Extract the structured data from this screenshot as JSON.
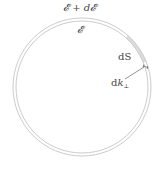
{
  "diagram": {
    "labels": {
      "outer_surface": "𝓔 + d𝓔",
      "inner_surface": "𝓔",
      "area_element": "dS",
      "normal_d": "d",
      "normal_k": "k",
      "normal_sub": "⊥"
    },
    "shapes": {
      "outer_circle": {
        "cx": 82,
        "cy": 87,
        "r": 69
      },
      "inner_circle": {
        "cx": 82,
        "cy": 87,
        "r": 66
      },
      "shaded_patch": {
        "from_deg": 22,
        "to_deg": 48
      }
    },
    "colors": {
      "circle_stroke": "#cccccc",
      "patch_fill": "#dddddd",
      "text": "#444444",
      "arrow": "#555555"
    }
  }
}
